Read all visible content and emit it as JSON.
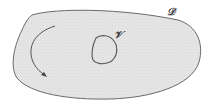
{
  "diagram": {
    "region_outer": {
      "label": "𝒟",
      "fill": "#e4e4e4",
      "stroke": "#6a6a6a"
    },
    "region_inner": {
      "label": "𝒱",
      "stroke": "#555555"
    },
    "arrow": {
      "description": "curved orientation arrow",
      "stroke": "#555555"
    },
    "background": "#ffffff"
  }
}
